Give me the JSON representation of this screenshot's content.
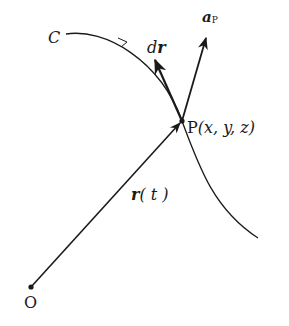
{
  "diagram": {
    "type": "vector-curve-diagram",
    "colors": {
      "ink": "#1a1a1a",
      "background": "#ffffff"
    },
    "curve": {
      "label": "C",
      "name": "curve C"
    },
    "point_P": {
      "label": "P",
      "coords": "(x, y, z)"
    },
    "origin": {
      "label": "O"
    },
    "vectors": {
      "position": {
        "label_main": "r",
        "label_arg": "( t )"
      },
      "differential": {
        "label_prefix": "d",
        "label_main": "r"
      },
      "a_P": {
        "label_main": "a",
        "label_sub": "P"
      }
    }
  }
}
